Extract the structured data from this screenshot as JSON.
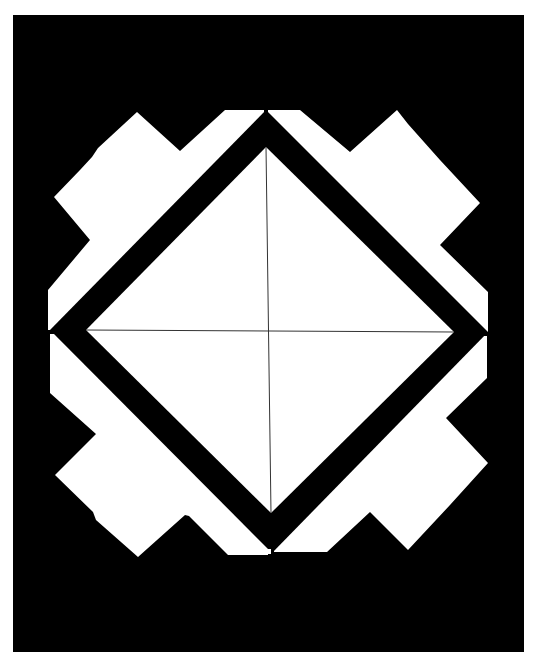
{
  "figure": {
    "description": "Black-and-white geometric emblem: a white diamond with a thick black border and thin crosshair lines, set inside a white stepped cross-shaped field on a black rectangular background",
    "colors": {
      "page_background": "#ffffff",
      "frame": "#000000",
      "field": "#ffffff",
      "diamond_border": "#000000",
      "diamond_fill": "#ffffff",
      "crosshair": "#333333"
    },
    "frame": {
      "x": 13,
      "y": 15,
      "width": 511,
      "height": 637
    },
    "diamond": {
      "outer": {
        "top": [
          266,
          110
        ],
        "right": [
          488,
          332
        ],
        "bottom": [
          272,
          553
        ],
        "left": [
          50,
          330
        ]
      },
      "inner": {
        "top": [
          266,
          147
        ],
        "right": [
          454,
          332
        ],
        "bottom": [
          271,
          513
        ],
        "left": [
          86,
          330
        ]
      }
    },
    "crosshair": {
      "vertical": {
        "x1": 266,
        "y1": 147,
        "x2": 271,
        "y2": 513
      },
      "horizontal": {
        "x1": 86,
        "y1": 330,
        "x2": 454,
        "y2": 332
      },
      "center": [
        268,
        331
      ]
    }
  }
}
